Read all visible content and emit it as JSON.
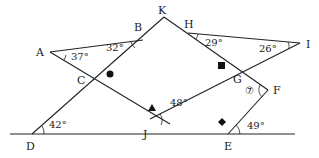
{
  "diagram": {
    "type": "geometry-angles",
    "points": {
      "A": {
        "label": "A"
      },
      "B": {
        "label": "B"
      },
      "C": {
        "label": "C"
      },
      "D": {
        "label": "D"
      },
      "E": {
        "label": "E"
      },
      "F": {
        "label": "F"
      },
      "G": {
        "label": "G"
      },
      "H": {
        "label": "H"
      },
      "I": {
        "label": "I"
      },
      "J": {
        "label": "J"
      },
      "K": {
        "label": "K"
      }
    },
    "angles": {
      "A": "37°",
      "B": "32°",
      "H": "29°",
      "I": "26°",
      "J": "48°",
      "D": "42°",
      "E": "49°",
      "F": "⑦"
    },
    "markers": {
      "C": "circle",
      "J": "triangle",
      "G": "square",
      "E": "diamond"
    }
  }
}
